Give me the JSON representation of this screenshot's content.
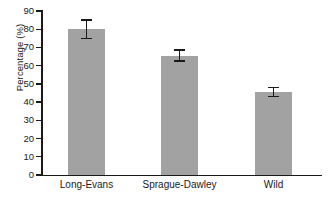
{
  "chart_data": {
    "type": "bar",
    "title": "",
    "xlabel": "",
    "ylabel": "Percentage (%)",
    "categories": [
      "Long-Evans",
      "Sprague-Dawley",
      "Wild"
    ],
    "values": [
      80,
      65.5,
      45.5
    ],
    "errors": [
      5,
      3,
      2.5
    ],
    "error_type": "symmetric",
    "ylim": [
      0,
      90
    ],
    "yticks": [
      0,
      10,
      20,
      30,
      40,
      50,
      60,
      70,
      80,
      90
    ],
    "ytick_labels": [
      "0",
      "10",
      "20",
      "30",
      "40",
      "50",
      "60",
      "70",
      "80",
      "90"
    ],
    "grid": false,
    "legend": null,
    "bar_color": "#a2a2a2",
    "axis_color": "#1a1a1a",
    "background": "#ffffff"
  }
}
